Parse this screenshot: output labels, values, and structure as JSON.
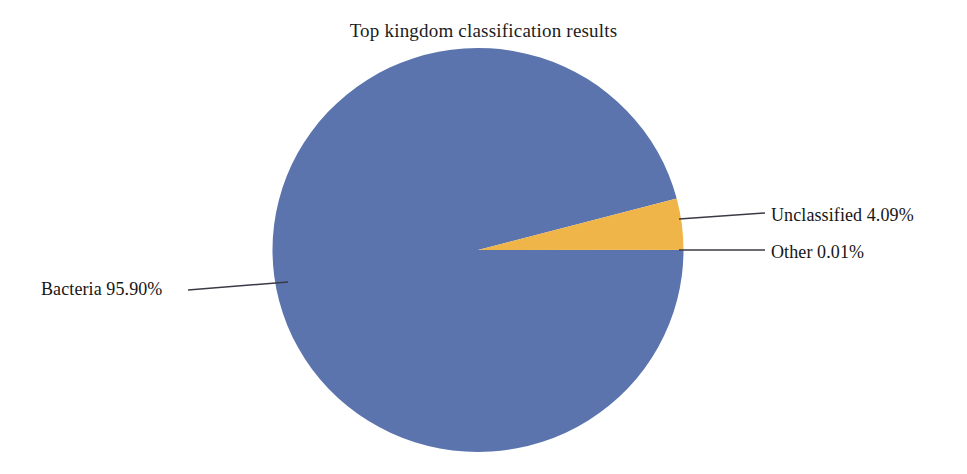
{
  "chart_data": {
    "type": "pie",
    "title": "Top kingdom classification results",
    "xlabel": "",
    "ylabel": "",
    "legend_position": "none",
    "grid": false,
    "labels": [
      "Bacteria",
      "Unclassified",
      "Other"
    ],
    "values": [
      95.9,
      4.09,
      0.01
    ],
    "value_unit": "%",
    "colors": [
      "#5B74AE",
      "#EFB549",
      "#EFB549"
    ],
    "annotations": [
      "Bacteria 95.90%",
      "Unclassified 4.09%",
      "Other 0.01%"
    ],
    "slices": [
      {
        "name": "Bacteria",
        "value": 95.9,
        "label": "Bacteria 95.90%",
        "color": "#5B74AE",
        "start_angle_deg": 14.8,
        "end_angle_deg": 360.0
      },
      {
        "name": "Unclassified",
        "value": 4.09,
        "label": "Unclassified 4.09%",
        "color": "#EFB549",
        "start_angle_deg": 0.04,
        "end_angle_deg": 14.76
      },
      {
        "name": "Other",
        "value": 0.01,
        "label": "Other 0.01%",
        "color": "#EFB549",
        "start_angle_deg": 0.0,
        "end_angle_deg": 0.04
      }
    ]
  },
  "figure": {
    "title": "Top kingdom classification results",
    "background_color": "#FFFFFF",
    "leader_line_color": "#3A3A46"
  },
  "labels": {
    "bacteria": "Bacteria 95.90%",
    "unclassified": "Unclassified 4.09%",
    "other": "Other 0.01%"
  }
}
